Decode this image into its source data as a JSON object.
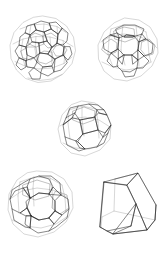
{
  "figure": {
    "background_color": "#ffffff",
    "width": 166,
    "height": 253,
    "colors": {
      "back_edge": "#9b9b9b",
      "mid_edge": "#6d6d6d",
      "front_edge": "#1d1d1d",
      "background": "#ffffff"
    },
    "layout_rows": [
      {
        "row": 1,
        "count": 2
      },
      {
        "row": 2,
        "count": 1
      },
      {
        "row": 3,
        "count": 2
      }
    ],
    "shapes": [
      {
        "id": "shape-top-left",
        "name": "truncated-icosahedron",
        "label": "Truncated icosahedron",
        "position": {
          "x": 8,
          "y": 14,
          "w": 70,
          "h": 72
        },
        "face_counts": {
          "hexagons": 20,
          "pentagons": 12
        },
        "vertex_count": 60,
        "edge_count": 90
      },
      {
        "id": "shape-top-right",
        "name": "truncated-cuboctahedron",
        "label": "Truncated cuboctahedron",
        "position": {
          "x": 96,
          "y": 16,
          "w": 64,
          "h": 70
        },
        "face_counts": {
          "octagons": 6,
          "hexagons": 8,
          "squares": 12
        },
        "vertex_count": 48,
        "edge_count": 72
      },
      {
        "id": "shape-middle",
        "name": "truncated-octahedron",
        "label": "Truncated octahedron",
        "position": {
          "x": 56,
          "y": 98,
          "w": 58,
          "h": 62
        },
        "face_counts": {
          "hexagons": 8,
          "squares": 6
        },
        "vertex_count": 24,
        "edge_count": 36
      },
      {
        "id": "shape-bottom-left",
        "name": "truncated-dodecahedron",
        "label": "Truncated dodecahedron",
        "position": {
          "x": 6,
          "y": 168,
          "w": 70,
          "h": 74
        },
        "face_counts": {
          "decagons": 12,
          "triangles": 20
        },
        "vertex_count": 60,
        "edge_count": 90
      },
      {
        "id": "shape-bottom-right",
        "name": "truncated-tetrahedron",
        "label": "Truncated tetrahedron",
        "position": {
          "x": 92,
          "y": 168,
          "w": 70,
          "h": 74
        },
        "face_counts": {
          "hexagons": 4,
          "triangles": 4
        },
        "vertex_count": 12,
        "edge_count": 18
      }
    ]
  }
}
